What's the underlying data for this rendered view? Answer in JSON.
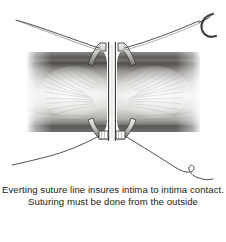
{
  "figure": {
    "medium": "graphite pencil illustration",
    "background_color": "#ffffff",
    "ink_color": "#3a3a3a",
    "tissue_light": "#f2f1ef",
    "tissue_mid": "#b9b7b4",
    "tissue_dark": "#5d5b59",
    "lumen_color": "#fbfbfb"
  },
  "caption": {
    "line_1": "Everting suture line insures intima to intima contact.",
    "line_2": "Suturing must be done from the outside"
  },
  "illustration": {
    "parts": [
      {
        "name": "vessel-wall-left",
        "label": "left vessel wall in cross-section"
      },
      {
        "name": "vessel-wall-right",
        "label": "right vessel wall in cross-section"
      },
      {
        "name": "everted-edge-left",
        "label": "everted intimal cuff, left"
      },
      {
        "name": "everted-edge-right",
        "label": "everted intimal cuff, right"
      },
      {
        "name": "anastomosis-seam",
        "label": "intima to intima contact line"
      },
      {
        "name": "suture-thread-upper-left",
        "label": "upper left suture strand"
      },
      {
        "name": "suture-thread-upper-right",
        "label": "upper right suture strand"
      },
      {
        "name": "suture-thread-lower-left",
        "label": "lower left suture strand"
      },
      {
        "name": "suture-thread-lower-right",
        "label": "lower right suture strand"
      },
      {
        "name": "suture-knot-left",
        "label": "suture bite, left edge"
      },
      {
        "name": "suture-knot-right",
        "label": "suture bite, right edge"
      },
      {
        "name": "curved-needle",
        "label": "curved surgical needle"
      }
    ]
  }
}
